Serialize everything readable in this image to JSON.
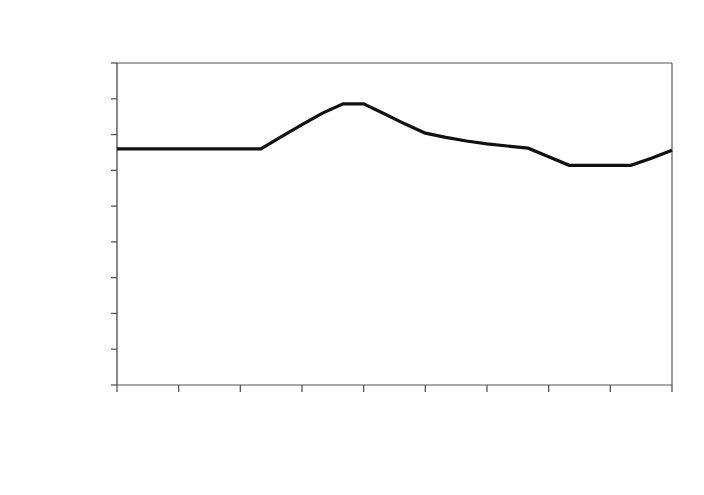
{
  "chart_data": {
    "type": "line",
    "title": "Ethanol",
    "xlabel": "",
    "ylabel": "$/gal",
    "ylim": [
      0.0,
      4.5
    ],
    "ytick_labels": [
      "4.50",
      "4.00",
      "3.50",
      "3.00",
      "2.50",
      "2.00",
      "1.50",
      "1.00",
      "0.50",
      "0.00"
    ],
    "ytick_values": [
      4.5,
      4.0,
      3.5,
      3.0,
      2.5,
      2.0,
      1.5,
      1.0,
      0.5,
      0.0
    ],
    "xtick_labels": [
      "Dec-2007",
      "Mar-2008",
      "Jun-2008",
      "Sep-2008",
      "Dec-2008",
      "Mar-2009",
      "Jun-2009",
      "Sep-2009",
      "Dec-2009"
    ],
    "xtick_count_total": 10,
    "grid": false,
    "legend": "none",
    "line_color": "#111111",
    "line_width": 3.2,
    "axis_color": "#555555",
    "background_color": "#ffffff",
    "x": [
      "Dec-2007",
      "Jan-2008",
      "Feb-2008",
      "Mar-2008",
      "Apr-2008",
      "May-2008",
      "Jun-2008",
      "Jul-2008",
      "Aug-2008",
      "Sep-2008",
      "Oct-2008",
      "Nov-2008",
      "Dec-2008",
      "Jan-2009",
      "Feb-2009",
      "Mar-2009",
      "Apr-2009",
      "May-2009",
      "Jun-2009",
      "Jul-2009",
      "Aug-2009",
      "Sep-2009",
      "Oct-2009",
      "Nov-2009",
      "Dec-2009",
      "Jan-2010",
      "Feb-2010",
      "Mar-2010"
    ],
    "values": [
      3.3,
      3.3,
      3.3,
      3.3,
      3.3,
      3.3,
      3.3,
      3.3,
      3.47,
      3.64,
      3.8,
      3.93,
      3.93,
      3.79,
      3.65,
      3.52,
      3.46,
      3.41,
      3.37,
      3.34,
      3.31,
      3.19,
      3.07,
      3.07,
      3.07,
      3.07,
      3.17,
      3.28
    ],
    "series": [
      {
        "name": "Ethanol",
        "values": [
          3.3,
          3.3,
          3.3,
          3.3,
          3.3,
          3.3,
          3.3,
          3.3,
          3.47,
          3.64,
          3.8,
          3.93,
          3.93,
          3.79,
          3.65,
          3.52,
          3.46,
          3.41,
          3.37,
          3.34,
          3.31,
          3.19,
          3.07,
          3.07,
          3.07,
          3.07,
          3.17,
          3.28
        ]
      }
    ],
    "annotations": {
      "start_value": "3.30",
      "peak_value": "3.93",
      "trough_value": "3.07",
      "end_value": "3.28"
    }
  }
}
